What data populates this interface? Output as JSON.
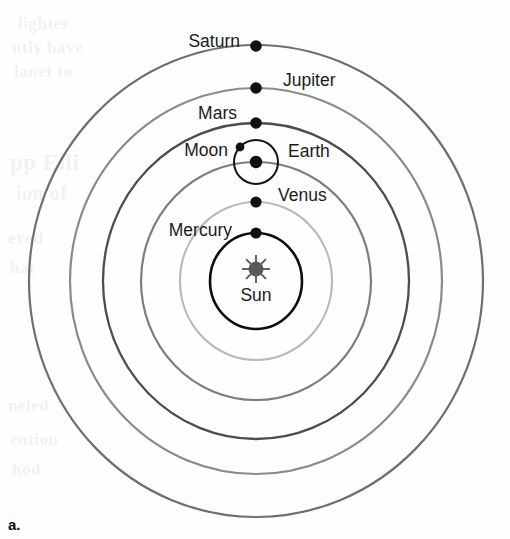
{
  "figure": {
    "panel_letter": "a.",
    "center_label": "Sun",
    "center_icon": "sun-icon",
    "center_icon_color": "#595959",
    "background_color": "#fefefe"
  },
  "chart_data": {
    "type": "diagram",
    "center": {
      "x": 256,
      "y": 281
    },
    "bodies": [
      {
        "name": "Mercury",
        "label": "Mercury",
        "label_side": "right",
        "label_x": 232,
        "label_y": 231,
        "orbit_rx": 46,
        "orbit_ry": 48,
        "orbit_color": "#0d0d0d",
        "orbit_width": 2.6,
        "dot_x": 256,
        "dot_y": 233,
        "dot_r": 5.6
      },
      {
        "name": "Venus",
        "label": "Venus",
        "label_side": "left",
        "label_x": 278,
        "label_y": 196,
        "orbit_rx": 76,
        "orbit_ry": 79,
        "orbit_color": "#b9b9b9",
        "orbit_width": 2.2,
        "dot_x": 256,
        "dot_y": 202,
        "dot_r": 5.6
      },
      {
        "name": "Earth",
        "label": "Earth",
        "label_side": "left",
        "label_x": 288,
        "label_y": 152,
        "orbit_rx": 115,
        "orbit_ry": 119,
        "orbit_color": "#7d7d7d",
        "orbit_width": 2.2,
        "dot_x": 256,
        "dot_y": 162,
        "dot_r": 6.2
      },
      {
        "name": "Moon",
        "label": "Moon",
        "label_side": "right",
        "label_x": 228,
        "label_y": 151,
        "orbit_rx": 22,
        "orbit_ry": 22,
        "orbit_color": "#141414",
        "orbit_width": 2.0,
        "dot_x": 240,
        "dot_y": 147,
        "dot_r": 4.4
      },
      {
        "name": "Mars",
        "label": "Mars",
        "label_side": "right",
        "label_x": 237,
        "label_y": 114,
        "orbit_rx": 153,
        "orbit_ry": 158,
        "orbit_color": "#4d4d4d",
        "orbit_width": 2.3,
        "dot_x": 256,
        "dot_y": 123,
        "dot_r": 5.8
      },
      {
        "name": "Jupiter",
        "label": "Jupiter",
        "label_side": "left",
        "label_x": 283,
        "label_y": 81,
        "orbit_rx": 186,
        "orbit_ry": 193,
        "orbit_color": "#8a8a8a",
        "orbit_width": 2.2,
        "dot_x": 256,
        "dot_y": 88,
        "dot_r": 5.8
      },
      {
        "name": "Saturn",
        "label": "Saturn",
        "label_side": "right",
        "label_x": 240,
        "label_y": 42,
        "orbit_rx": 227,
        "orbit_ry": 236,
        "orbit_color": "#6f6f6f",
        "orbit_width": 2.2,
        "dot_x": 256,
        "dot_y": 46,
        "dot_r": 5.8
      }
    ],
    "dot_color": "#111111"
  },
  "background_text": {
    "note": "Faint show-through text from the reverse side of the printed page",
    "lines": [
      {
        "text": "lighter",
        "x": 18,
        "y": 14,
        "size": 17
      },
      {
        "text": "ntly have",
        "x": 12,
        "y": 38,
        "size": 17
      },
      {
        "text": "lanet to",
        "x": 14,
        "y": 62,
        "size": 17
      },
      {
        "text": "pp Elli",
        "x": 10,
        "y": 150,
        "size": 23
      },
      {
        "text": "ion of",
        "x": 16,
        "y": 182,
        "size": 20
      },
      {
        "text": "ered",
        "x": 8,
        "y": 228,
        "size": 18
      },
      {
        "text": "hat",
        "x": 10,
        "y": 258,
        "size": 17
      },
      {
        "text": "neled",
        "x": 8,
        "y": 396,
        "size": 17
      },
      {
        "text": "ention",
        "x": 10,
        "y": 430,
        "size": 17
      },
      {
        "text": "hod",
        "x": 12,
        "y": 460,
        "size": 17
      }
    ]
  }
}
